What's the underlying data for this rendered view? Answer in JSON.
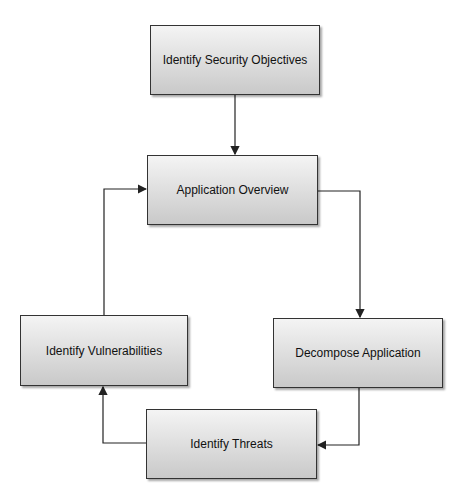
{
  "diagram": {
    "nodes": [
      {
        "id": "objectives",
        "label": "Identify Security Objectives"
      },
      {
        "id": "overview",
        "label": "Application Overview"
      },
      {
        "id": "decompose",
        "label": "Decompose Application"
      },
      {
        "id": "threats",
        "label": "Identify Threats"
      },
      {
        "id": "vulnerabilities",
        "label": "Identify Vulnerabilities"
      }
    ],
    "edges": [
      {
        "from": "objectives",
        "to": "overview"
      },
      {
        "from": "overview",
        "to": "decompose"
      },
      {
        "from": "decompose",
        "to": "threats"
      },
      {
        "from": "threats",
        "to": "vulnerabilities"
      },
      {
        "from": "vulnerabilities",
        "to": "overview"
      }
    ],
    "colors": {
      "border": "#333333",
      "fill_top": "#f4f4f4",
      "fill_bottom": "#c9c9c9",
      "line": "#222222"
    }
  }
}
